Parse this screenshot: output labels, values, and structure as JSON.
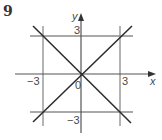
{
  "question": {
    "number": "9"
  },
  "diagram": {
    "type": "coordinate-graph",
    "axes": {
      "x_label": "x",
      "y_label": "y"
    },
    "tick_labels": {
      "x_neg": "−3",
      "x_pos": "3",
      "y_pos": "3",
      "y_neg": "−3",
      "origin": "0"
    },
    "lines": [
      {
        "equation": "x = -3",
        "kind": "vertical"
      },
      {
        "equation": "x = 3",
        "kind": "vertical"
      },
      {
        "equation": "y = 3",
        "kind": "horizontal"
      },
      {
        "equation": "y = -3",
        "kind": "horizontal"
      },
      {
        "equation": "y = x",
        "kind": "diagonal"
      },
      {
        "equation": "y = -x",
        "kind": "diagonal"
      }
    ],
    "colors": {
      "grid_lines": "#8c8c8c",
      "diagonals": "#2b2b2b",
      "axes": "#555555"
    }
  }
}
